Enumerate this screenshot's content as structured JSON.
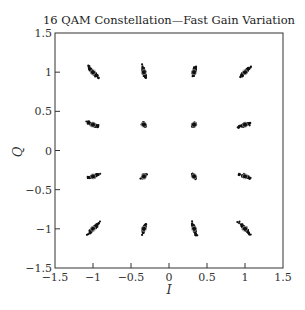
{
  "chart_data": {
    "type": "scatter",
    "title": "16 QAM Constellation—Fast Gain Variation",
    "xlabel": "I",
    "ylabel": "Q",
    "xlim": [
      -1.5,
      1.5
    ],
    "ylim": [
      -1.5,
      1.5
    ],
    "xticks": [
      "-1.5",
      "-1",
      "-0.5",
      "0",
      "0.5",
      "1",
      "1.5"
    ],
    "yticks": [
      "-1.5",
      "-1",
      "-0.5",
      "0",
      "0.5",
      "1",
      "1.5"
    ],
    "grid": false,
    "legend": null,
    "constellation_points": [
      {
        "I": -1.0,
        "Q": 1.0
      },
      {
        "I": -0.33,
        "Q": 1.0
      },
      {
        "I": 0.33,
        "Q": 1.0
      },
      {
        "I": 1.0,
        "Q": 1.0
      },
      {
        "I": -1.0,
        "Q": 0.33
      },
      {
        "I": -0.33,
        "Q": 0.33
      },
      {
        "I": 0.33,
        "Q": 0.33
      },
      {
        "I": 1.0,
        "Q": 0.33
      },
      {
        "I": -1.0,
        "Q": -0.33
      },
      {
        "I": -0.33,
        "Q": -0.33
      },
      {
        "I": 0.33,
        "Q": -0.33
      },
      {
        "I": 1.0,
        "Q": -0.33
      },
      {
        "I": -1.0,
        "Q": -1.0
      },
      {
        "I": -0.33,
        "Q": -1.0
      },
      {
        "I": 0.33,
        "Q": -1.0
      },
      {
        "I": 1.0,
        "Q": -1.0
      }
    ]
  }
}
